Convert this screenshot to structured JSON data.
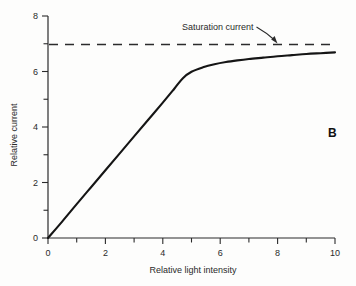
{
  "chart_data": {
    "type": "line",
    "title": "",
    "panel_label": "B",
    "xlabel": "Relative light intensity",
    "ylabel": "Relative current",
    "xlim": [
      0,
      10
    ],
    "ylim": [
      0,
      8
    ],
    "grid": false,
    "legend": "none",
    "x_major_ticks": [
      0,
      2,
      4,
      6,
      8,
      10
    ],
    "x_major_tick_labels": [
      "0",
      "2",
      "4",
      "6",
      "8",
      "10"
    ],
    "x_minor_ticks": [
      1,
      3,
      5,
      7,
      9
    ],
    "y_major_ticks": [
      0,
      2,
      4,
      6,
      8
    ],
    "y_major_tick_labels": [
      "0",
      "2",
      "4",
      "6",
      "8"
    ],
    "y_minor_ticks": [
      1,
      3,
      5,
      7
    ],
    "series": [
      {
        "name": "Photocurrent response",
        "style": "solid",
        "color": "#151515",
        "x": [
          0.0,
          0.5,
          1.0,
          1.5,
          2.0,
          2.5,
          3.0,
          3.5,
          4.0,
          4.4,
          4.7,
          5.0,
          5.4,
          5.8,
          6.2,
          6.6,
          7.0,
          7.5,
          8.0,
          8.5,
          9.0,
          9.5,
          10.0
        ],
        "y": [
          0.0,
          0.6,
          1.22,
          1.83,
          2.44,
          3.05,
          3.66,
          4.27,
          4.88,
          5.38,
          5.76,
          5.99,
          6.15,
          6.26,
          6.34,
          6.4,
          6.45,
          6.5,
          6.55,
          6.59,
          6.63,
          6.66,
          6.69
        ]
      },
      {
        "name": "Saturation current",
        "style": "dashed",
        "color": "#2b2b2b",
        "x": [
          0,
          10
        ],
        "y": [
          7,
          7
        ]
      }
    ],
    "annotations": [
      {
        "text": "Saturation current",
        "x_value": 6.5,
        "y_value": 7.6,
        "arrow_from": [
          6.9,
          7.55
        ],
        "arrow_to": [
          7.95,
          7.15
        ]
      }
    ]
  }
}
